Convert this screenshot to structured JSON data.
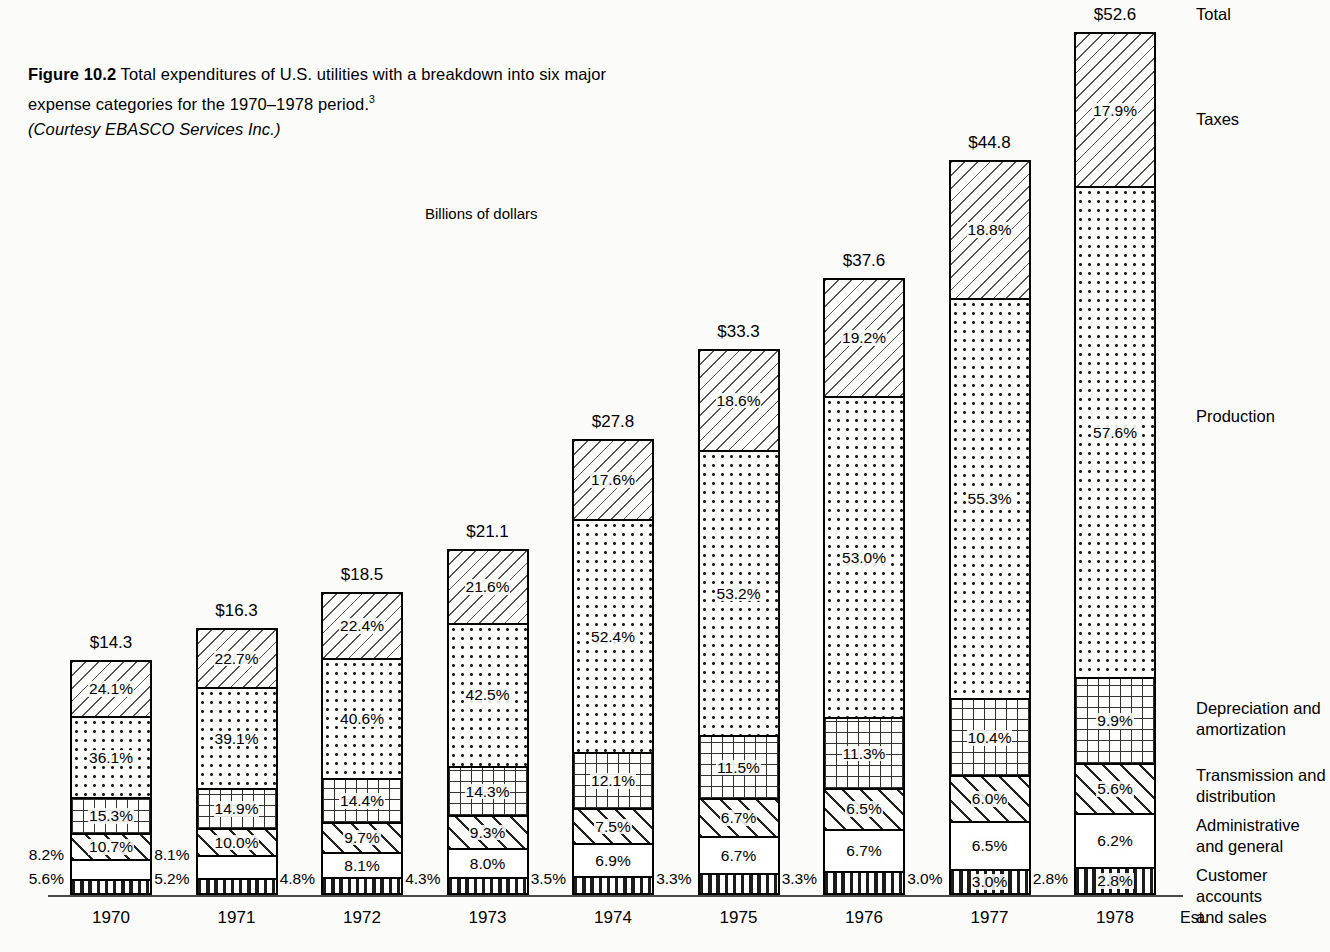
{
  "figure": {
    "number": "Figure 10.2",
    "caption_body": "Total expenditures of U.S. utilities with a breakdown into six major expense categories for the 1970–1978 period.",
    "footnote_marker": "3",
    "courtesy": "(Courtesy EBASCO Services Inc.)"
  },
  "axis_title": "Billions of dollars",
  "legend_labels": {
    "total": "Total",
    "taxes": "Taxes",
    "production": "Production",
    "depreciation": "Depreciation and\namortization",
    "transmission": "Transmission and\ndistribution",
    "administrative": "Administrative\nand general",
    "customer": "Customer accounts\nand sales"
  },
  "estimate_note": "Est.",
  "chart_data": {
    "type": "bar",
    "subtype": "stacked-percentage",
    "title": "Total expenditures of U.S. utilities with a breakdown into six major expense categories for the 1970–1978 period.",
    "xlabel": "",
    "ylabel": "Billions of dollars",
    "grid": false,
    "legend_position": "right",
    "categories": [
      "1970",
      "1971",
      "1972",
      "1973",
      "1974",
      "1975",
      "1976",
      "1977",
      "1978"
    ],
    "totals_label": [
      "$14.3",
      "$16.3",
      "$18.5",
      "$21.1",
      "$27.8",
      "$33.3",
      "$37.6",
      "$44.8",
      "$52.6"
    ],
    "totals": [
      14.3,
      16.3,
      18.5,
      21.1,
      27.8,
      33.3,
      37.6,
      44.8,
      52.6
    ],
    "series": [
      {
        "name": "Taxes",
        "pattern": "diagonal-left-hatch",
        "values": [
          24.1,
          22.7,
          22.4,
          21.6,
          17.6,
          18.6,
          19.2,
          18.8,
          17.9
        ],
        "labels": [
          "24.1%",
          "22.7%",
          "22.4%",
          "21.6%",
          "17.6%",
          "18.6%",
          "19.2%",
          "18.8%",
          "17.9%"
        ]
      },
      {
        "name": "Production",
        "pattern": "dot-screen",
        "values": [
          36.1,
          39.1,
          40.6,
          42.5,
          52.4,
          53.2,
          53.0,
          55.3,
          57.6
        ],
        "labels": [
          "36.1%",
          "39.1%",
          "40.6%",
          "42.5%",
          "52.4%",
          "53.2%",
          "53.0%",
          "55.3%",
          "57.6%"
        ]
      },
      {
        "name": "Depreciation and amortization",
        "pattern": "square-grid",
        "values": [
          15.3,
          14.9,
          14.4,
          14.3,
          12.1,
          11.5,
          11.3,
          10.4,
          9.9
        ],
        "labels": [
          "15.3%",
          "14.9%",
          "14.4%",
          "14.3%",
          "12.1%",
          "11.5%",
          "11.3%",
          "10.4%",
          "9.9%"
        ]
      },
      {
        "name": "Transmission and distribution",
        "pattern": "diagonal-right-hatch",
        "values": [
          10.7,
          10.0,
          9.7,
          9.3,
          7.5,
          6.7,
          6.5,
          6.0,
          5.6
        ],
        "labels": [
          "10.7%",
          "10.0%",
          "9.7%",
          "9.3%",
          "7.5%",
          "6.7%",
          "6.5%",
          "6.0%",
          "5.6%"
        ]
      },
      {
        "name": "Administrative and general",
        "pattern": "blank",
        "values": [
          8.2,
          8.1,
          8.1,
          8.0,
          6.9,
          6.7,
          6.7,
          6.5,
          6.2
        ],
        "labels": [
          "8.2%",
          "8.1%",
          "8.1%",
          "8.0%",
          "6.9%",
          "6.7%",
          "6.7%",
          "6.5%",
          "6.2%"
        ]
      },
      {
        "name": "Customer accounts and sales",
        "pattern": "vertical-stripes",
        "values": [
          5.6,
          5.2,
          4.8,
          4.3,
          3.5,
          3.3,
          3.3,
          3.0,
          2.8
        ],
        "labels": [
          "5.6%",
          "5.2%",
          "4.8%",
          "4.3%",
          "3.5%",
          "3.3%",
          "3.3%",
          "3.0%",
          "2.8%"
        ]
      }
    ],
    "outside_left_labels": {
      "1970": [
        "8.2%",
        "5.6%"
      ],
      "1971": [
        "8.1%",
        "5.2%"
      ],
      "1972": [
        "4.8%"
      ],
      "1973": [
        "4.3%"
      ],
      "1974": [
        "3.5%"
      ],
      "1975": [
        "3.3%"
      ],
      "1976": [
        "3.3%"
      ],
      "1977": [
        "3.0%"
      ],
      "1978": [
        "2.8%"
      ]
    }
  }
}
